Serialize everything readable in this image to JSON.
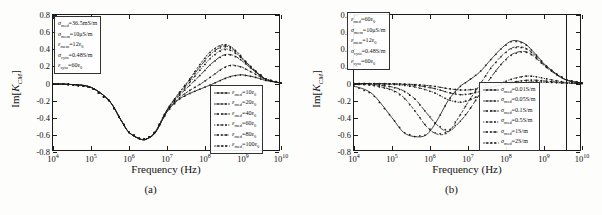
{
  "figure": {
    "panels": [
      {
        "id": "a",
        "caption": "(a)",
        "axis": {
          "xlabel": "Frequency (Hz)",
          "ylabel_prefix": "Im[",
          "ylabel_symbol": "K",
          "ylabel_sub": "CM",
          "ylabel_suffix": "]",
          "yticks": [
            "0.8",
            "0.6",
            "0.4",
            "0.2",
            "0",
            "-0.2",
            "-0.4",
            "-0.6",
            "-0.8"
          ],
          "xticks": [
            "4",
            "5",
            "6",
            "7",
            "8",
            "9",
            "10"
          ],
          "xtick_base": "10"
        },
        "param_box": [
          {
            "sym": "σ",
            "sub": "med",
            "val": "=36.5mS/m"
          },
          {
            "sym": "σ",
            "sub": "mem",
            "val": "=10μS/m"
          },
          {
            "sym": "ε",
            "sub": "mem",
            "val": "=12ε",
            "val_sub": "0"
          },
          {
            "sym": "σ",
            "sub": "cyto",
            "val": "=0.48S/m"
          },
          {
            "sym": "ε",
            "sub": "cyto",
            "val": "=60ε",
            "val_sub": "0"
          }
        ],
        "legend": [
          {
            "sym": "ε",
            "sub": "med",
            "val": "=10ε",
            "val_sub": "0"
          },
          {
            "sym": "ε",
            "sub": "med",
            "val": "=20ε",
            "val_sub": "0"
          },
          {
            "sym": "ε",
            "sub": "med",
            "val": "=40ε",
            "val_sub": "0"
          },
          {
            "sym": "ε",
            "sub": "med",
            "val": "=60ε",
            "val_sub": "0"
          },
          {
            "sym": "ε",
            "sub": "med",
            "val": "=80ε",
            "val_sub": "0"
          },
          {
            "sym": "ε",
            "sub": "med",
            "val": "=100ε",
            "val_sub": "0"
          }
        ]
      },
      {
        "id": "b",
        "caption": "(b)",
        "axis": {
          "xlabel": "Frequency (Hz)",
          "ylabel_prefix": "Im[",
          "ylabel_symbol": "K",
          "ylabel_sub": "CM",
          "ylabel_suffix": "]",
          "yticks": [
            "0.8",
            "0.6",
            "0.4",
            "0.2",
            "0",
            "-0.2",
            "-0.4",
            "-0.6",
            "-0.8"
          ],
          "xticks": [
            "4",
            "5",
            "6",
            "7",
            "8",
            "9",
            "10"
          ],
          "xtick_base": "10"
        },
        "param_box": [
          {
            "sym": "ε",
            "sub": "med",
            "val": "=60ε",
            "val_sub": "0"
          },
          {
            "sym": "σ",
            "sub": "mem",
            "val": "=10μS/m"
          },
          {
            "sym": "ε",
            "sub": "mem",
            "val": "=12ε",
            "val_sub": "0"
          },
          {
            "sym": "σ",
            "sub": "cyto",
            "val": "=0.48S/m"
          },
          {
            "sym": "ε",
            "sub": "cyto",
            "val": "=60ε",
            "val_sub": "0"
          }
        ],
        "legend": [
          {
            "sym": "σ",
            "sub": "med",
            "val": "=0.01S/m"
          },
          {
            "sym": "σ",
            "sub": "med",
            "val": "=0.05S/m"
          },
          {
            "sym": "σ",
            "sub": "med",
            "val": "=0.1S/m"
          },
          {
            "sym": "σ",
            "sub": "med",
            "val": "=0.5S/m"
          },
          {
            "sym": "σ",
            "sub": "med",
            "val": "=1S/m"
          },
          {
            "sym": "σ",
            "sub": "med",
            "val": "=2S/m"
          }
        ]
      }
    ]
  },
  "chart_data": [
    {
      "type": "line",
      "panel": "a",
      "title": "",
      "xlabel": "Frequency (Hz)",
      "ylabel": "Im[K_CM]",
      "xscale": "log",
      "xlim": [
        10000,
        10000000000
      ],
      "ylim": [
        -0.8,
        0.8
      ],
      "grid": false,
      "legend_position": "lower-right",
      "x": [
        10000.0,
        30000.0,
        100000.0,
        300000.0,
        600000.0,
        1000000.0,
        2000000.0,
        3000000.0,
        5000000.0,
        10000000.0,
        20000000.0,
        40000000.0,
        80000000.0,
        150000000.0,
        300000000.0,
        500000000.0,
        800000000.0,
        1000000000.0,
        2000000000.0,
        4000000000.0,
        10000000000.0
      ],
      "series": [
        {
          "name": "ε_med=10ε_0",
          "values": [
            -0.005,
            -0.012,
            -0.045,
            -0.2,
            -0.42,
            -0.57,
            -0.65,
            -0.645,
            -0.57,
            -0.33,
            -0.19,
            -0.115,
            -0.06,
            -0.01,
            0.05,
            0.085,
            0.1,
            0.1,
            0.075,
            0.035,
            0.005
          ]
        },
        {
          "name": "ε_med=20ε_0",
          "values": [
            -0.005,
            -0.012,
            -0.045,
            -0.2,
            -0.42,
            -0.57,
            -0.65,
            -0.645,
            -0.57,
            -0.33,
            -0.175,
            -0.08,
            0.0,
            0.085,
            0.18,
            0.215,
            0.2,
            0.185,
            0.115,
            0.045,
            0.005
          ]
        },
        {
          "name": "ε_med=40ε_0",
          "values": [
            -0.005,
            -0.012,
            -0.045,
            -0.2,
            -0.42,
            -0.57,
            -0.65,
            -0.645,
            -0.565,
            -0.32,
            -0.15,
            -0.02,
            0.11,
            0.235,
            0.33,
            0.335,
            0.29,
            0.255,
            0.145,
            0.05,
            0.005
          ]
        },
        {
          "name": "ε_med=60ε_0",
          "values": [
            -0.005,
            -0.012,
            -0.045,
            -0.2,
            -0.42,
            -0.57,
            -0.65,
            -0.645,
            -0.562,
            -0.315,
            -0.135,
            0.015,
            0.175,
            0.31,
            0.4,
            0.385,
            0.32,
            0.275,
            0.15,
            0.05,
            0.005
          ]
        },
        {
          "name": "ε_med=80ε_0",
          "values": [
            -0.005,
            -0.012,
            -0.045,
            -0.2,
            -0.42,
            -0.57,
            -0.65,
            -0.645,
            -0.56,
            -0.31,
            -0.125,
            0.04,
            0.215,
            0.355,
            0.435,
            0.41,
            0.335,
            0.285,
            0.155,
            0.052,
            0.005
          ]
        },
        {
          "name": "ε_med=100ε_0",
          "values": [
            -0.005,
            -0.012,
            -0.045,
            -0.2,
            -0.42,
            -0.57,
            -0.65,
            -0.645,
            -0.558,
            -0.305,
            -0.118,
            0.055,
            0.245,
            0.385,
            0.455,
            0.425,
            0.345,
            0.29,
            0.157,
            0.053,
            0.005
          ]
        }
      ]
    },
    {
      "type": "line",
      "panel": "b",
      "title": "",
      "xlabel": "Frequency (Hz)",
      "ylabel": "Im[K_CM]",
      "xscale": "log",
      "xlim": [
        10000,
        10000000000
      ],
      "ylim": [
        -0.8,
        0.8
      ],
      "grid": false,
      "legend_position": "lower-right",
      "x": [
        10000.0,
        30000.0,
        100000.0,
        200000.0,
        400000.0,
        800000.0,
        1500000.0,
        3000000.0,
        6000000.0,
        10000000.0,
        20000000.0,
        40000000.0,
        80000000.0,
        150000000.0,
        300000000.0,
        500000000.0,
        800000000.0,
        1000000000.0,
        2000000000.0,
        4000000000.0,
        10000000000.0
      ],
      "series": [
        {
          "name": "σ_med=0.01S/m",
          "values": [
            -0.03,
            -0.12,
            -0.4,
            -0.57,
            -0.62,
            -0.6,
            -0.44,
            -0.2,
            -0.04,
            0.03,
            0.13,
            0.28,
            0.42,
            0.5,
            0.47,
            0.38,
            0.28,
            0.23,
            0.12,
            0.04,
            0.005
          ]
        },
        {
          "name": "σ_med=0.05S/m",
          "values": [
            -0.008,
            -0.02,
            -0.075,
            -0.16,
            -0.32,
            -0.5,
            -0.59,
            -0.57,
            -0.38,
            -0.22,
            -0.02,
            0.18,
            0.33,
            0.42,
            0.42,
            0.355,
            0.265,
            0.22,
            0.115,
            0.04,
            0.005
          ]
        },
        {
          "name": "σ_med=0.1S/m",
          "values": [
            -0.004,
            -0.01,
            -0.04,
            -0.085,
            -0.18,
            -0.34,
            -0.48,
            -0.56,
            -0.45,
            -0.33,
            -0.13,
            0.07,
            0.24,
            0.345,
            0.375,
            0.33,
            0.25,
            0.21,
            0.11,
            0.038,
            0.005
          ]
        },
        {
          "name": "σ_med=0.5S/m",
          "values": [
            -0.001,
            -0.003,
            -0.01,
            -0.02,
            -0.04,
            -0.075,
            -0.12,
            -0.19,
            -0.22,
            -0.2,
            -0.14,
            -0.06,
            0.01,
            0.055,
            0.085,
            0.085,
            0.07,
            0.06,
            0.035,
            0.012,
            0.002
          ]
        },
        {
          "name": "σ_med=1S/m",
          "values": [
            -0.0005,
            -0.0015,
            -0.005,
            -0.01,
            -0.02,
            -0.04,
            -0.065,
            -0.105,
            -0.13,
            -0.125,
            -0.095,
            -0.05,
            -0.01,
            0.015,
            0.035,
            0.04,
            0.035,
            0.03,
            0.018,
            0.006,
            0.001
          ]
        },
        {
          "name": "σ_med=2S/m",
          "values": [
            -0.0003,
            -0.001,
            -0.003,
            -0.006,
            -0.012,
            -0.022,
            -0.037,
            -0.06,
            -0.075,
            -0.075,
            -0.06,
            -0.038,
            -0.015,
            0.0,
            0.012,
            0.018,
            0.018,
            0.016,
            0.01,
            0.004,
            0.001
          ]
        }
      ]
    }
  ]
}
